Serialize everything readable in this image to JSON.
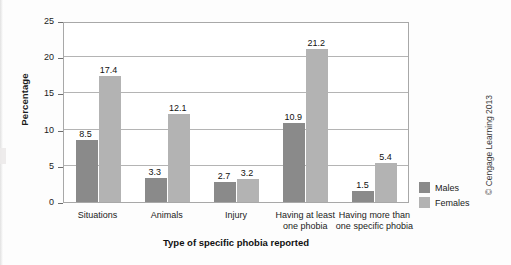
{
  "chart_data": {
    "type": "bar",
    "title": "",
    "xlabel": "Type of specific phobia reported",
    "ylabel": "Percentage",
    "ylim": [
      0,
      25
    ],
    "yticks": [
      0,
      5,
      10,
      15,
      20,
      25
    ],
    "grid": true,
    "legend_position": "right",
    "categories": [
      "Situations",
      "Animals",
      "Injury",
      "Having at least one phobia",
      "Having more than one specific phobia"
    ],
    "category_lines": [
      [
        "Situations"
      ],
      [
        "Animals"
      ],
      [
        "Injury"
      ],
      [
        "Having at least",
        "one phobia"
      ],
      [
        "Having more than",
        "one specific phobia"
      ]
    ],
    "series": [
      {
        "name": "Males",
        "color": "#8a8a8a",
        "values": [
          8.5,
          3.3,
          2.7,
          10.9,
          1.5
        ]
      },
      {
        "name": "Females",
        "color": "#b3b3b3",
        "values": [
          17.4,
          12.1,
          3.2,
          21.2,
          5.4
        ]
      }
    ],
    "value_labels": {
      "males": [
        "8.5",
        "3.3",
        "2.7",
        "10.9",
        "1.5"
      ],
      "females": [
        "17.4",
        "12.1",
        "3.2",
        "21.2",
        "5.4"
      ]
    }
  },
  "credit": "© Cengage Learning 2013"
}
